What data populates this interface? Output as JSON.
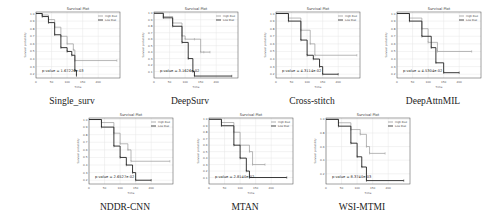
{
  "chart_data": [
    {
      "type": "line",
      "title": "Survival Plot",
      "caption": "Single_surv",
      "xlabel": "Time",
      "ylabel": "Survival probability",
      "xticks": [
        0,
        50,
        100,
        150,
        200
      ],
      "yticks": [
        0.2,
        0.3,
        0.4,
        0.5,
        0.6,
        0.7,
        0.8,
        0.9,
        1.0
      ],
      "xlim": [
        0,
        270
      ],
      "ylim": [
        0.15,
        1.02
      ],
      "legend": [
        "High Risk",
        "Low Risk"
      ],
      "p_value": "p-value = 1.67226e-03",
      "series": [
        {
          "name": "High Risk",
          "x": [
            0,
            20,
            40,
            60,
            80,
            100,
            120,
            125,
            260
          ],
          "y": [
            1.0,
            0.98,
            0.92,
            0.82,
            0.7,
            0.6,
            0.52,
            0.38,
            0.38
          ]
        },
        {
          "name": "Low Risk",
          "x": [
            0,
            20,
            40,
            60,
            80,
            100,
            115,
            125,
            130
          ],
          "y": [
            1.0,
            0.96,
            0.88,
            0.72,
            0.55,
            0.5,
            0.45,
            0.25,
            0.18
          ]
        }
      ]
    },
    {
      "type": "line",
      "title": "Survival Plot",
      "caption": "DeepSurv",
      "xlabel": "Time",
      "ylabel": "Survival probability",
      "xticks": [
        0,
        50,
        100,
        150,
        200
      ],
      "yticks": [
        0.1,
        0.2,
        0.3,
        0.4,
        0.5,
        0.6,
        0.7,
        0.8,
        0.9,
        1.0
      ],
      "xlim": [
        0,
        270
      ],
      "ylim": [
        0.0,
        1.02
      ],
      "legend": [
        "High Risk",
        "Low Risk"
      ],
      "p_value": "p-value = 3.1626e-02",
      "series": [
        {
          "name": "High Risk",
          "x": [
            0,
            30,
            60,
            90,
            100,
            130,
            150,
            160,
            180
          ],
          "y": [
            1.0,
            0.95,
            0.85,
            0.65,
            0.6,
            0.6,
            0.4,
            0.4,
            0.4
          ]
        },
        {
          "name": "Low Risk",
          "x": [
            0,
            30,
            60,
            90,
            110,
            125,
            130,
            250
          ],
          "y": [
            1.0,
            0.93,
            0.8,
            0.55,
            0.3,
            0.1,
            0.03,
            0.03
          ]
        }
      ]
    },
    {
      "type": "line",
      "title": "Survival Plot",
      "caption": "Cross-stitch",
      "xlabel": "Time",
      "ylabel": "Survival probability",
      "xticks": [
        0,
        50,
        100,
        150,
        200
      ],
      "yticks": [
        0.2,
        0.3,
        0.4,
        0.5,
        0.6,
        0.7,
        0.8,
        0.9,
        1.0
      ],
      "xlim": [
        0,
        270
      ],
      "ylim": [
        0.15,
        1.02
      ],
      "legend": [
        "High Risk",
        "Low Risk"
      ],
      "p_value": "p-value = 4.3114e-02",
      "series": [
        {
          "name": "High Risk",
          "x": [
            0,
            40,
            80,
            110,
            125,
            260
          ],
          "y": [
            1.0,
            0.94,
            0.78,
            0.6,
            0.45,
            0.45
          ]
        },
        {
          "name": "Low Risk",
          "x": [
            0,
            40,
            80,
            100,
            120,
            140,
            150,
            200
          ],
          "y": [
            1.0,
            0.9,
            0.65,
            0.45,
            0.4,
            0.3,
            0.2,
            0.2
          ]
        }
      ]
    },
    {
      "type": "line",
      "title": "Survival Plot",
      "caption": "DeepAttnMIL",
      "xlabel": "Time",
      "ylabel": "Survival probability",
      "xticks": [
        0,
        50,
        100,
        150,
        200
      ],
      "yticks": [
        0.2,
        0.3,
        0.4,
        0.5,
        0.6,
        0.7,
        0.8,
        0.9,
        1.0
      ],
      "xlim": [
        0,
        270
      ],
      "ylim": [
        0.15,
        1.02
      ],
      "legend": [
        "High Risk",
        "Low Risk"
      ],
      "p_value": "p-value = 4.5304e-02",
      "series": [
        {
          "name": "High Risk",
          "x": [
            0,
            40,
            80,
            100,
            130,
            240
          ],
          "y": [
            1.0,
            0.94,
            0.8,
            0.62,
            0.5,
            0.5
          ]
        },
        {
          "name": "Low Risk",
          "x": [
            0,
            40,
            80,
            110,
            125,
            150,
            200
          ],
          "y": [
            1.0,
            0.9,
            0.7,
            0.55,
            0.35,
            0.22,
            0.22
          ]
        }
      ]
    },
    {
      "type": "line",
      "title": "Survival Plot",
      "caption": "NDDR-CNN",
      "xlabel": "Time",
      "ylabel": "Survival probability",
      "xticks": [
        0,
        50,
        100,
        150,
        200
      ],
      "yticks": [
        0.2,
        0.3,
        0.4,
        0.5,
        0.6,
        0.7,
        0.8,
        0.9,
        1.0
      ],
      "xlim": [
        0,
        270
      ],
      "ylim": [
        0.15,
        1.02
      ],
      "legend": [
        "High Risk",
        "Low Risk"
      ],
      "p_value": "p-value = 2.6527e-02",
      "series": [
        {
          "name": "High Risk",
          "x": [
            0,
            40,
            80,
            100,
            125,
            135,
            260
          ],
          "y": [
            1.0,
            0.96,
            0.82,
            0.68,
            0.6,
            0.45,
            0.45
          ]
        },
        {
          "name": "Low Risk",
          "x": [
            0,
            40,
            80,
            100,
            120,
            140,
            150,
            200
          ],
          "y": [
            1.0,
            0.9,
            0.65,
            0.5,
            0.4,
            0.3,
            0.2,
            0.2
          ]
        }
      ]
    },
    {
      "type": "line",
      "title": "Survival Plot",
      "caption": "MTAN",
      "xlabel": "Time",
      "ylabel": "Survival probability",
      "xticks": [
        0,
        50,
        100,
        150,
        200
      ],
      "yticks": [
        0.1,
        0.2,
        0.3,
        0.4,
        0.5,
        0.6,
        0.7,
        0.8,
        0.9,
        1.0
      ],
      "xlim": [
        0,
        270
      ],
      "ylim": [
        0.0,
        1.02
      ],
      "legend": [
        "High Risk",
        "Low Risk"
      ],
      "p_value": "p-value = 2.8140e-02",
      "series": [
        {
          "name": "High Risk",
          "x": [
            0,
            40,
            80,
            100,
            130,
            140,
            180
          ],
          "y": [
            1.0,
            0.95,
            0.8,
            0.6,
            0.5,
            0.3,
            0.3
          ]
        },
        {
          "name": "Low Risk",
          "x": [
            0,
            40,
            80,
            100,
            120,
            130,
            250
          ],
          "y": [
            1.0,
            0.9,
            0.6,
            0.4,
            0.2,
            0.1,
            0.1
          ]
        }
      ]
    },
    {
      "type": "line",
      "title": "Survival Plot",
      "caption": "WSI-MTMI",
      "xlabel": "Time",
      "ylabel": "Survival probability",
      "xticks": [
        0,
        50,
        100,
        150,
        200
      ],
      "yticks": [
        0.2,
        0.4,
        0.6,
        0.8,
        1.0
      ],
      "xlim": [
        0,
        270
      ],
      "ylim": [
        0.05,
        1.02
      ],
      "legend": [
        "High Risk",
        "Low Risk"
      ],
      "p_value": "p-value = 8.3740e-03",
      "series": [
        {
          "name": "High Risk",
          "x": [
            0,
            40,
            80,
            110,
            130,
            140,
            190
          ],
          "y": [
            1.0,
            0.95,
            0.85,
            0.78,
            0.6,
            0.5,
            0.5
          ]
        },
        {
          "name": "Low Risk",
          "x": [
            0,
            40,
            80,
            100,
            115,
            130,
            250
          ],
          "y": [
            1.0,
            0.9,
            0.65,
            0.45,
            0.3,
            0.1,
            0.1
          ]
        }
      ]
    }
  ]
}
